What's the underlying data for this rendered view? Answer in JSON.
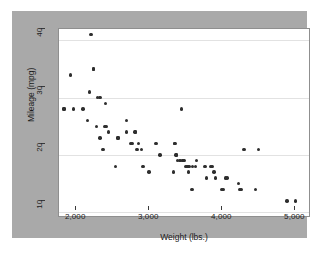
{
  "chart_data": {
    "type": "scatter",
    "title": "",
    "xlabel": "Weight (lbs.)",
    "ylabel": "Mileage (mpg)",
    "xlim": [
      1600,
      5050
    ],
    "ylim": [
      9,
      42
    ],
    "xticks": [
      "2,000",
      "3,000",
      "4,000",
      "5,000"
    ],
    "xtick_values": [
      2000,
      3000,
      4000,
      5000
    ],
    "yticks": [
      "10",
      "20",
      "30",
      "40"
    ],
    "ytick_values": [
      10,
      20,
      30,
      40
    ],
    "grid": "horizontal",
    "legend": "none",
    "marker_color": "#2e2e2e",
    "plot_background": "#ffffff",
    "graph_background": "#a9a9a9",
    "gridline_color": "#e2e2e2",
    "n_points": 74,
    "x": [
      2040,
      2070,
      2070,
      1760,
      2020,
      2130,
      2160,
      2240,
      1800,
      1930,
      1990,
      2110,
      2230,
      2250,
      2280,
      2410,
      2520,
      1670,
      1670,
      2160,
      2200,
      2370,
      2410,
      2520,
      2580,
      2600,
      2640,
      2650,
      2670,
      2690,
      2730,
      2750,
      2830,
      2930,
      2980,
      3170,
      3180,
      3190,
      3200,
      3210,
      3220,
      3250,
      3260,
      3280,
      3290,
      3300,
      3310,
      3330,
      3350,
      3370,
      3380,
      3420,
      3430,
      3470,
      3480,
      3600,
      3620,
      3670,
      3690,
      3700,
      3720,
      3740,
      3830,
      3850,
      3880,
      3900,
      4060,
      4080,
      4100,
      4130,
      4290,
      4330,
      4720,
      4840
    ],
    "y": [
      41,
      35,
      35,
      34,
      31,
      30,
      30,
      29,
      28,
      28,
      26,
      25,
      25,
      25,
      24,
      23,
      26,
      28,
      28,
      23,
      21,
      18,
      23,
      24,
      22,
      22,
      24,
      24,
      21,
      22,
      21,
      18,
      17,
      22,
      20,
      17,
      22,
      22,
      20,
      20,
      19,
      19,
      19,
      28,
      19,
      19,
      19,
      18,
      18,
      17,
      18,
      14,
      18,
      18,
      19,
      18,
      16,
      18,
      18,
      18,
      17,
      16,
      14,
      14,
      16,
      16,
      15,
      14,
      14,
      21,
      14,
      21,
      12,
      12
    ]
  }
}
